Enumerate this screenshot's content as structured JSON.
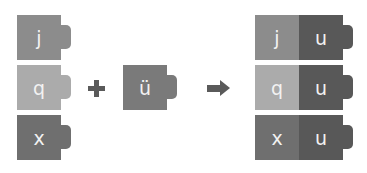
{
  "colors": {
    "j": "#8c8c8c",
    "q": "#ababab",
    "x": "#6f6f6f",
    "u": "#585858",
    "operator": "#5a5a5a"
  },
  "left_blocks": [
    {
      "label": "j"
    },
    {
      "label": "q"
    },
    {
      "label": "x"
    }
  ],
  "middle_block": {
    "label": "ü"
  },
  "operators": {
    "plus": "+",
    "arrow": "➡"
  },
  "result_blocks": [
    {
      "left": "j",
      "right": "u"
    },
    {
      "left": "q",
      "right": "u"
    },
    {
      "left": "x",
      "right": "u"
    }
  ]
}
